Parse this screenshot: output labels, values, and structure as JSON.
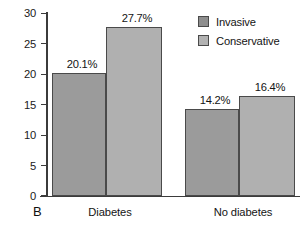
{
  "panel": {
    "letter": "B"
  },
  "legend": {
    "position": "top-right",
    "entries": [
      {
        "label": "Invasive",
        "color": "#9b9b9b",
        "icon": "legend-swatch-icon"
      },
      {
        "label": "Conservative",
        "color": "#b0b0b0",
        "icon": "legend-swatch-icon"
      }
    ]
  },
  "axis": {
    "y_ticks": [
      "0",
      "5",
      "10",
      "15",
      "20",
      "25",
      "30"
    ]
  },
  "chart_data": {
    "type": "bar",
    "title": "",
    "subtitle": "",
    "xlabel": "",
    "ylabel": "",
    "ylim": [
      0,
      30
    ],
    "yticks": [
      0,
      5,
      10,
      15,
      20,
      25,
      30
    ],
    "grid": false,
    "legend_position": "top-right",
    "categories": [
      "Diabetes",
      "No diabetes"
    ],
    "series": [
      {
        "name": "Invasive",
        "color": "#9b9b9b",
        "values": [
          20.1,
          14.2
        ],
        "data_labels": [
          "20.1%",
          "14.2%"
        ]
      },
      {
        "name": "Conservative",
        "color": "#b0b0b0",
        "values": [
          27.7,
          16.4
        ],
        "data_labels": [
          "27.7%",
          "16.4%"
        ]
      }
    ],
    "annotations": [
      "B"
    ]
  }
}
